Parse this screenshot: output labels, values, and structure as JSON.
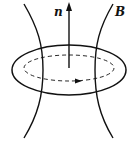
{
  "diagram": {
    "labels": {
      "normal": "n",
      "field": "B"
    },
    "colors": {
      "stroke": "#111111",
      "background": "#ffffff"
    },
    "elements": [
      {
        "type": "ellipse",
        "role": "loop",
        "style": "solid"
      },
      {
        "type": "ellipse",
        "role": "current-path",
        "style": "dashed",
        "arrow": "right"
      },
      {
        "type": "arrow",
        "role": "normal-vector",
        "label": "n",
        "direction": "up"
      },
      {
        "type": "curve",
        "role": "field-line-left"
      },
      {
        "type": "curve",
        "role": "field-line-right",
        "label": "B"
      }
    ]
  }
}
